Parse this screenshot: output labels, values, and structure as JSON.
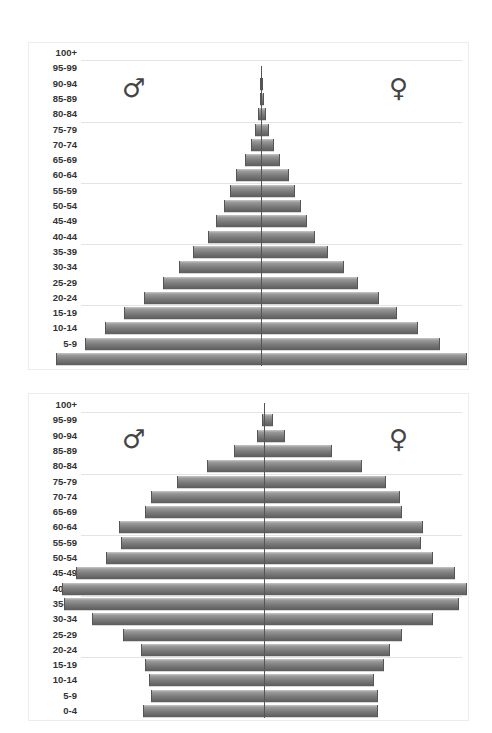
{
  "chart_data": [
    {
      "type": "bar",
      "subtype": "population-pyramid",
      "title": "",
      "xlabel": "",
      "ylabel": "",
      "categories": [
        "100+",
        "95-99",
        "90-94",
        "85-89",
        "80-84",
        "75-79",
        "70-74",
        "65-69",
        "60-64",
        "55-59",
        "50-54",
        "45-49",
        "40-44",
        "35-39",
        "30-34",
        "25-29",
        "20-24",
        "15-19",
        "10-14",
        "5-9",
        "0-4"
      ],
      "series": [
        {
          "name": "Male",
          "symbol": "♂",
          "values": [
            0,
            0,
            0.5,
            0.5,
            1.5,
            3,
            5,
            8,
            12,
            15,
            18,
            22,
            26,
            33,
            40,
            48,
            57,
            67,
            76,
            86,
            100
          ]
        },
        {
          "name": "Female",
          "symbol": "♀",
          "values": [
            0,
            0,
            0.5,
            1,
            2,
            3.5,
            6,
            9,
            13,
            16,
            19,
            22,
            26,
            32,
            40,
            47,
            57,
            66,
            76,
            87,
            100
          ]
        }
      ],
      "xlim": [
        -100,
        100
      ],
      "grid": true,
      "legend": "symbols ♂ (left) and ♀ (right)"
    },
    {
      "type": "bar",
      "subtype": "population-pyramid",
      "title": "",
      "xlabel": "",
      "ylabel": "",
      "categories": [
        "100+",
        "95-99",
        "90-94",
        "85-89",
        "80-84",
        "75-79",
        "70-74",
        "65-69",
        "60-64",
        "55-59",
        "50-54",
        "45-49",
        "40-44",
        "35-39",
        "30-34",
        "25-29",
        "20-24",
        "15-19",
        "10-14",
        "5-9",
        "0-4"
      ],
      "series": [
        {
          "name": "Male",
          "symbol": "♂",
          "values": [
            0,
            1,
            3.5,
            15,
            28,
            43,
            56,
            59,
            72,
            71,
            78,
            93,
            100,
            99,
            85,
            70,
            61,
            59,
            57,
            56,
            60
          ]
        },
        {
          "name": "Female",
          "symbol": "♀",
          "values": [
            0,
            4,
            10,
            33,
            48,
            60,
            67,
            68,
            78,
            77,
            83,
            94,
            100,
            96,
            83,
            68,
            62,
            59,
            54,
            56,
            56
          ]
        }
      ],
      "xlim": [
        -100,
        100
      ],
      "grid": true,
      "legend": "symbols ♂ (left) and ♀ (right)"
    }
  ],
  "charts": [
    {
      "male_symbol": "♂",
      "female_symbol": "♀"
    },
    {
      "male_symbol": "♂",
      "female_symbol": "♀"
    }
  ],
  "colors": {
    "bar": "#7a7a7a",
    "axis": "#555555",
    "grid": "#e4e4e4"
  }
}
